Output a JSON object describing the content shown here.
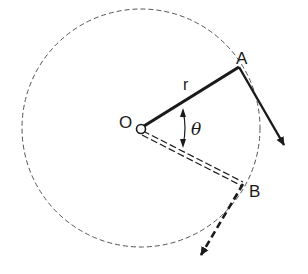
{
  "diagram": {
    "type": "rotating-radius-vector",
    "labels": {
      "origin": "O",
      "point_a": "A",
      "point_b": "B",
      "radius": "r",
      "angle": "θ"
    },
    "colors": {
      "stroke": "#1a1a1a",
      "dashed_circle": "#555555",
      "background": "#ffffff"
    },
    "elements": [
      {
        "name": "dashed circle",
        "center": "O",
        "radius_label": "r"
      },
      {
        "name": "solid radius O to A",
        "label": "r"
      },
      {
        "name": "solid tangent velocity arrow at A"
      },
      {
        "name": "dashed radius O to B (double line)"
      },
      {
        "name": "dashed tangent velocity arrow at B"
      },
      {
        "name": "angle arc between OA and OB",
        "label": "θ"
      }
    ]
  }
}
